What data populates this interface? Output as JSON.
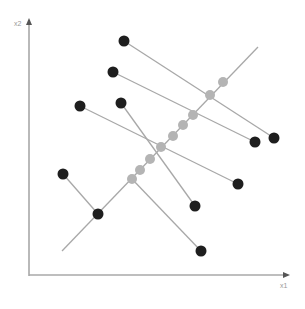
{
  "diagram": {
    "type": "projection-onto-line",
    "axes": {
      "x_label": "x1",
      "y_label": "x2",
      "origin": [
        29,
        275
      ],
      "x_end": [
        290,
        275
      ],
      "y_end": [
        29,
        18
      ],
      "color": "#a8a8a8"
    },
    "principal_line": {
      "from": [
        62,
        251
      ],
      "to": [
        258,
        47
      ],
      "color": "#a8a8a8"
    },
    "projection_segments": [
      {
        "from": [
          124,
          41
        ],
        "to": [
          274,
          138
        ]
      },
      {
        "from": [
          113,
          72
        ],
        "to": [
          255,
          142
        ]
      },
      {
        "from": [
          80,
          106
        ],
        "to": [
          238,
          184
        ]
      },
      {
        "from": [
          121,
          103
        ],
        "to": [
          195,
          206
        ]
      },
      {
        "from": [
          63,
          174
        ],
        "to": [
          98,
          214
        ]
      },
      {
        "from": [
          132,
          179
        ],
        "to": [
          201,
          251
        ]
      }
    ],
    "data_points": [
      [
        124,
        41
      ],
      [
        113,
        72
      ],
      [
        80,
        106
      ],
      [
        121,
        103
      ],
      [
        63,
        174
      ],
      [
        98,
        214
      ],
      [
        274,
        138
      ],
      [
        255,
        142
      ],
      [
        238,
        184
      ],
      [
        195,
        206
      ],
      [
        201,
        251
      ]
    ],
    "projected_points": [
      [
        223,
        82
      ],
      [
        210,
        95
      ],
      [
        193,
        115
      ],
      [
        183,
        125
      ],
      [
        173,
        136
      ],
      [
        161,
        147
      ],
      [
        150,
        159
      ],
      [
        140,
        170
      ],
      [
        132,
        179
      ]
    ],
    "colors": {
      "data_point": "#1e1e1e",
      "projected_point": "#b4b4b4",
      "line": "#a8a8a8"
    }
  }
}
